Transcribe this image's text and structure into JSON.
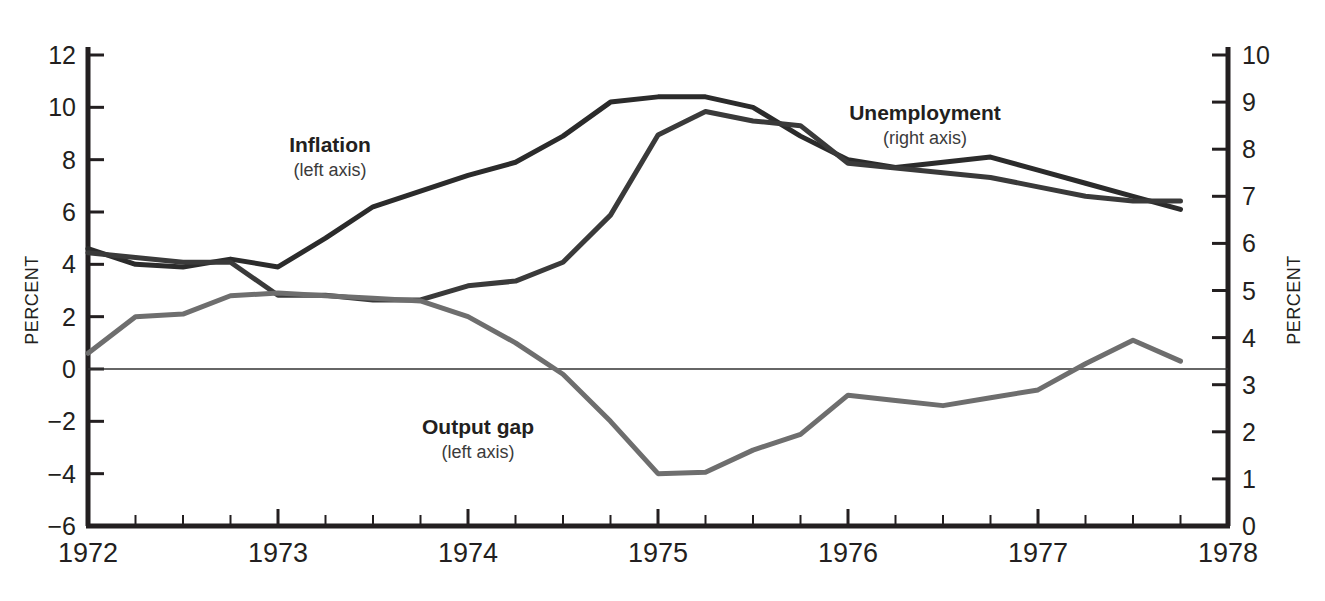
{
  "chart_data": {
    "type": "line",
    "title": "",
    "xlabel": "",
    "ylabel": "PERCENT",
    "y2label": "PERCENT",
    "grid": false,
    "legend_position": "inline-annotations",
    "x_tick_labels": [
      "1972",
      "1973",
      "1974",
      "1975",
      "1976",
      "1977",
      "1978"
    ],
    "x_tick_values": [
      1972,
      1973,
      1974,
      1975,
      1976,
      1977,
      1978
    ],
    "x_minor_ticks_per_year": 4,
    "xlim": [
      1972,
      1978
    ],
    "ylim": [
      -6,
      12
    ],
    "y_tick_labels": [
      "12",
      "10",
      "8",
      "6",
      "4",
      "2",
      "0",
      "−2",
      "−4",
      "−6"
    ],
    "y_tick_values": [
      12,
      10,
      8,
      6,
      4,
      2,
      0,
      -2,
      -4,
      -6
    ],
    "y2lim": [
      0,
      10
    ],
    "y2_tick_labels": [
      "10",
      "9",
      "8",
      "7",
      "6",
      "5",
      "4",
      "3",
      "2",
      "1",
      "0"
    ],
    "y2_tick_values": [
      10,
      9,
      8,
      7,
      6,
      5,
      4,
      3,
      2,
      1,
      0
    ],
    "zero_line": 0,
    "series": [
      {
        "name": "Inflation",
        "axis": "left",
        "color": "#2b2b2b",
        "width": 5,
        "x": [
          1972.0,
          1972.25,
          1972.5,
          1972.75,
          1973.0,
          1973.25,
          1973.5,
          1973.75,
          1974.0,
          1974.25,
          1974.5,
          1974.75,
          1975.0,
          1975.25,
          1975.5,
          1975.75,
          1976.0,
          1976.25,
          1976.5,
          1976.75,
          1977.0,
          1977.25,
          1977.5,
          1977.75
        ],
        "values": [
          4.6,
          4.0,
          3.9,
          4.2,
          3.9,
          5.0,
          6.2,
          6.8,
          7.4,
          7.9,
          8.9,
          10.2,
          10.4,
          10.4,
          10.0,
          8.9,
          8.0,
          7.7,
          7.9,
          8.1,
          7.6,
          7.1,
          6.6,
          6.1
        ]
      },
      {
        "name": "Unemployment",
        "axis": "right",
        "color": "#3a3a3a",
        "width": 5,
        "x": [
          1972.0,
          1972.25,
          1972.5,
          1972.75,
          1973.0,
          1973.25,
          1973.5,
          1973.75,
          1974.0,
          1974.25,
          1974.5,
          1974.75,
          1975.0,
          1975.25,
          1975.5,
          1975.75,
          1976.0,
          1976.25,
          1976.5,
          1976.75,
          1977.0,
          1977.25,
          1977.5,
          1977.75
        ],
        "values": [
          5.8,
          5.7,
          5.6,
          5.6,
          4.9,
          4.9,
          4.8,
          4.8,
          5.1,
          5.2,
          5.6,
          6.6,
          8.3,
          8.8,
          8.6,
          8.5,
          7.7,
          7.6,
          7.5,
          7.4,
          7.2,
          7.0,
          6.9,
          6.9
        ]
      },
      {
        "name": "Output gap",
        "axis": "left",
        "color": "#6e6e6e",
        "width": 5,
        "x": [
          1972.0,
          1972.25,
          1972.5,
          1972.75,
          1973.0,
          1973.25,
          1973.5,
          1973.75,
          1974.0,
          1974.25,
          1974.5,
          1974.75,
          1975.0,
          1975.25,
          1975.5,
          1975.75,
          1976.0,
          1976.25,
          1976.5,
          1976.75,
          1977.0,
          1977.25,
          1977.5,
          1977.75
        ],
        "values": [
          0.6,
          2.0,
          2.1,
          2.8,
          2.9,
          2.8,
          2.7,
          2.6,
          2.0,
          1.0,
          -0.2,
          -2.0,
          -4.0,
          -3.95,
          -3.1,
          -2.5,
          -1.0,
          -1.2,
          -1.4,
          -1.1,
          -0.8,
          0.2,
          1.1,
          0.3
        ]
      }
    ],
    "annotations": [
      {
        "name": "inflation-label",
        "title": "Inflation",
        "subtitle": "(left axis)",
        "x": 330,
        "y": 152
      },
      {
        "name": "unemployment-label",
        "title": "Unemployment",
        "subtitle": "(right axis)",
        "x": 925,
        "y": 120
      },
      {
        "name": "output-gap-label",
        "title": "Output gap",
        "subtitle": "(left axis)",
        "x": 478,
        "y": 434
      }
    ]
  },
  "axes": {
    "left_axis_title": "PERCENT",
    "right_axis_title": "PERCENT"
  },
  "colors": {
    "inflation": "#2b2b2b",
    "unemployment": "#3a3a3a",
    "output_gap": "#6e6e6e",
    "axis": "#231f20",
    "background": "#ffffff"
  }
}
